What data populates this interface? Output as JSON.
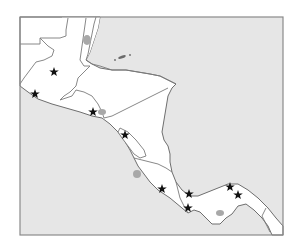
{
  "map": {
    "title": "Central America outline map",
    "region": "Central America",
    "colors": {
      "sea": "#e6e6e6",
      "land": "#ffffff",
      "border": "#7a7a7a",
      "lake": "#a8a8a8",
      "marker": "#111111"
    },
    "countries": [
      "Guatemala",
      "Belize",
      "El Salvador",
      "Honduras",
      "Nicaragua",
      "Costa Rica",
      "Panama"
    ],
    "markers": [
      {
        "id": "star-1",
        "icon": "star-icon",
        "x": 54,
        "y": 72
      },
      {
        "id": "star-2",
        "icon": "star-icon",
        "x": 35,
        "y": 94
      },
      {
        "id": "star-3",
        "icon": "star-icon",
        "x": 93,
        "y": 112
      },
      {
        "id": "star-4",
        "icon": "star-icon",
        "x": 125,
        "y": 135
      },
      {
        "id": "star-5",
        "icon": "star-icon",
        "x": 162,
        "y": 189
      },
      {
        "id": "star-6",
        "icon": "star-icon",
        "x": 189,
        "y": 194
      },
      {
        "id": "star-7",
        "icon": "star-icon",
        "x": 188,
        "y": 208
      },
      {
        "id": "star-8",
        "icon": "star-icon",
        "x": 230,
        "y": 187
      },
      {
        "id": "star-9",
        "icon": "star-icon",
        "x": 238,
        "y": 195
      }
    ]
  }
}
